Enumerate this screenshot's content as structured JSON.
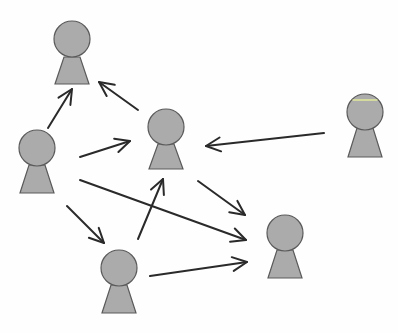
{
  "diagram": {
    "type": "directed-network",
    "colors": {
      "background": "#fefefe",
      "node_fill": "#ababab",
      "node_stroke": "#5a5a5a",
      "edge": "#2a2a2a",
      "highlight": "#e2e89a"
    },
    "nodes": [
      {
        "id": "top",
        "cx": 72,
        "cy": 39,
        "r": 18,
        "body_top": 57,
        "body_bottom": 84,
        "neck_half": 8,
        "base_half": 17
      },
      {
        "id": "left",
        "cx": 37,
        "cy": 148,
        "r": 18,
        "body_top": 165,
        "body_bottom": 193,
        "neck_half": 8,
        "base_half": 17
      },
      {
        "id": "center",
        "cx": 166,
        "cy": 127,
        "r": 18,
        "body_top": 144,
        "body_bottom": 169,
        "neck_half": 8,
        "base_half": 17
      },
      {
        "id": "right",
        "cx": 365,
        "cy": 112,
        "r": 18,
        "body_top": 128,
        "body_bottom": 157,
        "neck_half": 8,
        "base_half": 17,
        "highlight_band": true
      },
      {
        "id": "bottom",
        "cx": 119,
        "cy": 268,
        "r": 18,
        "body_top": 285,
        "body_bottom": 313,
        "neck_half": 8,
        "base_half": 17
      },
      {
        "id": "bottom-right",
        "cx": 285,
        "cy": 233,
        "r": 18,
        "body_top": 250,
        "body_bottom": 278,
        "neck_half": 8,
        "base_half": 17
      }
    ],
    "edges": [
      {
        "from": "left",
        "to": "top",
        "x1": 48,
        "y1": 128,
        "x2": 72,
        "y2": 89
      },
      {
        "from": "center",
        "to": "top",
        "x1": 138,
        "y1": 110,
        "x2": 99,
        "y2": 82
      },
      {
        "from": "left",
        "to": "center",
        "x1": 80,
        "y1": 157,
        "x2": 130,
        "y2": 141
      },
      {
        "from": "right",
        "to": "center",
        "x1": 324,
        "y1": 133,
        "x2": 206,
        "y2": 146
      },
      {
        "from": "left",
        "to": "bottom",
        "x1": 67,
        "y1": 206,
        "x2": 104,
        "y2": 243
      },
      {
        "from": "left",
        "to": "bottom-right",
        "x1": 80,
        "y1": 180,
        "x2": 246,
        "y2": 240
      },
      {
        "from": "bottom",
        "to": "center",
        "x1": 138,
        "y1": 239,
        "x2": 163,
        "y2": 179
      },
      {
        "from": "center",
        "to": "bottom-right",
        "x1": 198,
        "y1": 181,
        "x2": 245,
        "y2": 215
      },
      {
        "from": "bottom",
        "to": "bottom-right",
        "x1": 150,
        "y1": 276,
        "x2": 247,
        "y2": 262
      }
    ]
  }
}
